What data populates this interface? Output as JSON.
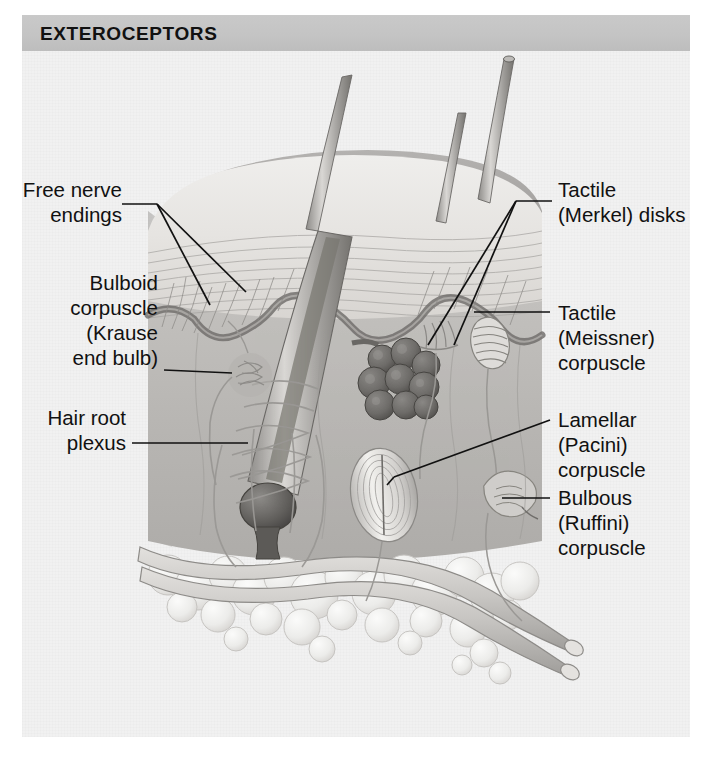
{
  "figure": {
    "title": "EXTEROCEPTORS",
    "banner_color": "#c4c4c4",
    "panel_background": "#f1f1f1",
    "style": "grayscale-airbrush-anatomical-illustration"
  },
  "labels": {
    "left": [
      {
        "id": "free-nerve-endings",
        "text": "Free nerve\nendings"
      },
      {
        "id": "bulboid-corpuscle",
        "text": "Bulboid\ncorpuscle\n(Krause\nend bulb)"
      },
      {
        "id": "hair-root-plexus",
        "text": "Hair root\nplexus"
      }
    ],
    "right": [
      {
        "id": "tactile-merkel-disks",
        "text": "Tactile\n(Merkel) disks"
      },
      {
        "id": "tactile-meissner-corpuscle",
        "text": "Tactile\n(Meissner)\ncorpuscle"
      },
      {
        "id": "lamellar-pacini-corpuscle",
        "text": "Lamellar\n(Pacini)\ncorpuscle"
      },
      {
        "id": "bulbous-ruffini-corpuscle",
        "text": "Bulbous\n(Ruffini)\ncorpuscle"
      }
    ]
  },
  "illustration_parts": {
    "hair_shafts": 3,
    "epidermis": "stratified wavy layer",
    "dermis": "mid-gray connective tissue",
    "hypodermis": "lobular adipose tissue",
    "structures": [
      "hair shaft",
      "hair follicle",
      "hair bulb",
      "sebaceous gland",
      "arrector pili",
      "free nerve endings",
      "Krause end bulb",
      "Merkel disks",
      "Meissner corpuscle",
      "Pacinian corpuscle",
      "Ruffini corpuscle",
      "hair root plexus",
      "cutaneous nerve bundle"
    ]
  },
  "colors": {
    "ink": "#111111",
    "banner": "#c4c4c4",
    "panel": "#f1f1f1",
    "epidermis_light": "#e9e6e2",
    "dermis_mid": "#b6b6b4",
    "dark_structure": "#6d6d6b",
    "fat_light": "#ededeb"
  }
}
